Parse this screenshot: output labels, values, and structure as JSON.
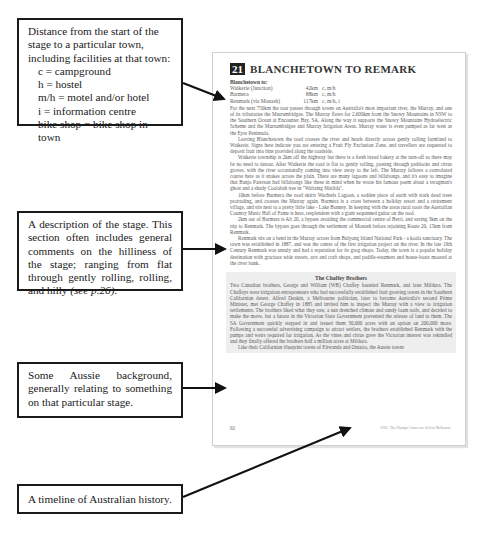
{
  "heading": {
    "text": "LAYOUT OF THE GUIDE"
  },
  "callouts": [
    {
      "id": "distances",
      "lines": [
        "Distance from the start of the",
        "stage to a particular town,",
        "including facilities at that town:"
      ],
      "legend": [
        "c  =  campground",
        "h  =  hostel",
        "m/h = motel and/or hotel",
        "i  =   information centre",
        "bike shop = bike shop in town"
      ]
    },
    {
      "id": "description",
      "text": "A description of the stage. This section often includes general comments on the hilliness of the stage; ranging from flat through gently rolling, rolling, and hilly",
      "italic_ref": "(see p.26)."
    },
    {
      "id": "background",
      "text": "Some Aussie background, generally relating to something on that particular stage."
    },
    {
      "id": "timeline",
      "text": "A timeline of Australian history."
    }
  ],
  "page": {
    "stage_number": "21",
    "stage_title": "BLANCHETOWN TO REMARK",
    "distances_heading": "Blanchetown to:",
    "distances": [
      {
        "town": "Waikerie (Junction)",
        "km": "42km",
        "facilities": "c, m/h"
      },
      {
        "town": "Barmera",
        "km": "88km",
        "facilities": "c, m/h"
      },
      {
        "town": "Renmark (via Monash)",
        "km": "117km",
        "facilities": "c, m/h, i"
      }
    ],
    "paragraphs": [
      "For the next 750km the tour passes through towns on Australia's most important river, the Murray, and one of its tributaries the Murrumbidgee. The Murray flows for 2,600km from the Snowy Mountains in NSW to the Southern Ocean at Encounter Bay, SA. Along the way it supports the Snowy Mountains Hydroelectric Scheme and the Murrumbidgee and Murray Irrigation Areas. Murray water is even pumped as far west as the Eyre Peninsula.",
      "Leaving Blanchetown the road crosses the river and heads directly across gently rolling farmland to Waikerie. Signs here indicate you are entering a Fruit Fly Exclusion Zone, and travellers are requested to deposit fruit into bins provided along the roadside.",
      "Waikerie township is 2km off the highway but there is a fresh bread bakery at the turn-off so there may be no need to detour. After Waikerie the road is flat to gently rolling, passing through paddocks and citrus groves, with the river occasionally coming into view away to the left. The Murray follows a convoluted course here as it snakes across the plain. There are many lagoons and billabongs, and it's easy to imagine that Banjo Paterson had billabongs like these in mind when he wrote his famous poem about a swagman's ghost and a shady Coolabah tree in \"Waltzing Matilda\".",
      "10km before Barmera the road skirts Wachtels Lagoon, a sodden piece of earth with stark dead trees protruding, and crosses the Murray again. Barmera is a cross between a holiday resort and a retirement village, and sits next to a pretty little lake - Lake Bonney. In keeping with the areas rural roots the Australian Country Music Hall of Fame is here, resplendent with a giant sequinned guitar on the roof.",
      "2km out of Barmera is Alt 20, a bypass avoiding the commercial centre of Berri, and saving 3km on the trip to Renmark. The bypass goes through the settlement of Monash before rejoining Route 20, 15km from Renmark.",
      "Renmark sits on a bend in the Murray across from Bulyong Island National Park - a koala sanctuary. The town was established in 1887, and was the centre of the first irrigation project on the river. In the late 19th Century Renmark was unruly and had a reputation for its grog shops. Today, the town is a popular holiday destination with gracious wide streets, arts and craft shops, and paddle-steamers and house-boats moored at the river bank."
    ],
    "box": {
      "title": "The Chaffey Brothers",
      "paragraphs": [
        "Two Canadian brothers, George and William (WB) Chaffey founded Renmark, and later Mildura. The Chaffeys were irrigation entrepreneurs who had successfully established fruit growing towns in the Southern Californian desert. Alfred Deakin, a Melbourne politician, later to become Australia's second Prime Minister, met George Chaffey in 1885 and invited him to inspect the Murray with a view to irrigation settlements. The brothers liked what they saw, a sun drenched climate and sandy loam soils, and decided to make the move, but a furore in the Victorian State Government prevented the release of land to them. The SA Government quickly stepped in and issued them 30,000 acres with an option on 200,000 more. Following a successful advertising campaign to attract settlers, the brothers established Renmark with the pumps and weirs required for irrigation. As the vines and citrus grew the Victorian interest was rekindled and they finally offered the brothers half a million acres at Mildura.",
        "Like their Californian blueprint towns of Etiwanda and Ontario, the Aussie towns"
      ]
    },
    "footer": {
      "page_number": "92",
      "timeline_note": "1938 - The Olympic Games are held in Melbourne"
    }
  },
  "colors": {
    "ink": "#1a1a1a",
    "page_text": "#5a5a5a",
    "box_shade": "#eeeeee",
    "stage_badge": "#222222"
  }
}
